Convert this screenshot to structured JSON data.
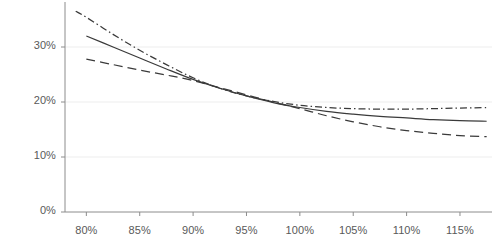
{
  "chart_data": {
    "type": "line",
    "title": "",
    "subtitle": "",
    "xlabel": "",
    "ylabel": "",
    "xlim": [
      78,
      118
    ],
    "ylim": [
      0,
      36
    ],
    "grid": true,
    "legend_position": "none",
    "x_tick_labels": [
      "80%",
      "85%",
      "90%",
      "95%",
      "100%",
      "105%",
      "110%",
      "115%"
    ],
    "x_tick_values": [
      80,
      85,
      90,
      95,
      100,
      105,
      110,
      115
    ],
    "y_tick_labels": [
      "0%",
      "10%",
      "20%",
      "30%"
    ],
    "y_tick_values": [
      0,
      10,
      20,
      30
    ],
    "series": [
      {
        "name": "series-dash-dot",
        "style": "dashdot",
        "color": "#3a3a3a",
        "x": [
          79,
          80,
          82.5,
          85,
          87.5,
          90,
          92.5,
          95,
          97.5,
          100,
          102.5,
          105,
          107.5,
          110,
          112.5,
          115,
          117.5
        ],
        "values": [
          36.5,
          35.4,
          32.3,
          29.4,
          26.8,
          24.4,
          22.5,
          21.1,
          20.1,
          19.4,
          19.0,
          18.8,
          18.7,
          18.7,
          18.8,
          18.9,
          19.0
        ]
      },
      {
        "name": "series-solid",
        "style": "solid",
        "color": "#3a3a3a",
        "x": [
          80,
          82.5,
          85,
          87.5,
          90,
          92.5,
          95,
          97.5,
          100,
          102.5,
          105,
          107.5,
          110,
          112.5,
          115,
          117.5
        ],
        "values": [
          32.0,
          30.0,
          28.0,
          26.0,
          24.1,
          22.5,
          21.1,
          19.9,
          19.0,
          18.3,
          17.8,
          17.4,
          17.1,
          16.8,
          16.6,
          16.5
        ]
      },
      {
        "name": "series-dashed",
        "style": "dashed",
        "color": "#3a3a3a",
        "x": [
          80,
          82.5,
          85,
          87.5,
          90,
          92.5,
          95,
          97.5,
          100,
          102.5,
          105,
          107.5,
          110,
          112.5,
          115,
          117.5
        ],
        "values": [
          27.8,
          26.8,
          25.8,
          24.9,
          23.9,
          22.6,
          21.3,
          20.0,
          18.8,
          17.5,
          16.4,
          15.5,
          14.8,
          14.3,
          13.9,
          13.7
        ]
      }
    ]
  },
  "axes": {
    "axis_color": "#8c8c8c",
    "grid_color": "#ededed",
    "tick_text_color": "#595959"
  }
}
